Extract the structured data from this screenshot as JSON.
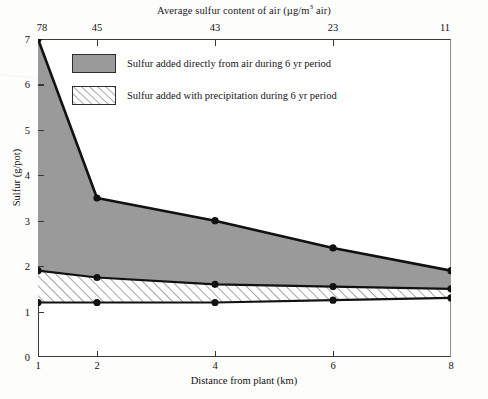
{
  "chart_data": {
    "type": "area",
    "xlabel": "Distance from plant (km)",
    "ylabel": "Sulfur (g/pot)",
    "x": [
      1,
      2,
      4,
      6,
      8
    ],
    "xlim": [
      1,
      8
    ],
    "ylim": [
      0,
      7
    ],
    "grid": false,
    "legend_position": "inside-top-left",
    "x_tick_labels": [
      "1",
      "2",
      "4",
      "6",
      "8"
    ],
    "y_tick_labels": [
      "0",
      "1",
      "2",
      "3",
      "4",
      "5",
      "6",
      "7"
    ],
    "top_axis_label": "Average sulfur content of air (µg/m³ air)",
    "top_axis_tick_labels": [
      "78",
      "45",
      "43",
      "23",
      "11"
    ],
    "top_axis_values": [
      78,
      45,
      43,
      23,
      11
    ],
    "series": [
      {
        "name": "Total sulfur (upper boundary of air-added band)",
        "values": [
          7.0,
          3.5,
          3.0,
          2.4,
          1.9
        ]
      },
      {
        "name": "Upper boundary of precipitation band",
        "values": [
          1.9,
          1.75,
          1.6,
          1.55,
          1.5
        ]
      },
      {
        "name": "Baseline (lower boundary of precipitation band)",
        "values": [
          1.2,
          1.2,
          1.2,
          1.25,
          1.3
        ]
      }
    ],
    "bands": [
      {
        "name": "Sulfur added directly from air during 6 yr period",
        "fill": "solid-gray",
        "color": "#9a9a9a",
        "upper": [
          7.0,
          3.5,
          3.0,
          2.4,
          1.9
        ],
        "lower": [
          1.9,
          1.75,
          1.6,
          1.55,
          1.5
        ]
      },
      {
        "name": "Sulfur added with precipitation during 6 yr period",
        "fill": "diagonal-hatch",
        "color": "#ffffff",
        "upper": [
          1.9,
          1.75,
          1.6,
          1.55,
          1.5
        ],
        "lower": [
          1.2,
          1.2,
          1.2,
          1.25,
          1.3
        ]
      }
    ]
  },
  "legend": {
    "items": [
      {
        "label": "Sulfur added directly from air during 6 yr period",
        "swatch": "solid-gray"
      },
      {
        "label": "Sulfur added with precipitation during 6 yr period",
        "swatch": "diagonal-hatch"
      }
    ]
  },
  "axes": {
    "top_title": "Average sulfur content of air (µg/m",
    "top_title_sup": "3",
    "top_title_tail": " air)",
    "x_title": "Distance from plant (km)",
    "y_title": "Sulfur (g/pot)"
  },
  "colors": {
    "band_air": "#9a9a9a",
    "band_precip": "#ffffff",
    "line": "#111111",
    "frame": "#3a3a3a",
    "page_background": "#fdfdfc"
  }
}
